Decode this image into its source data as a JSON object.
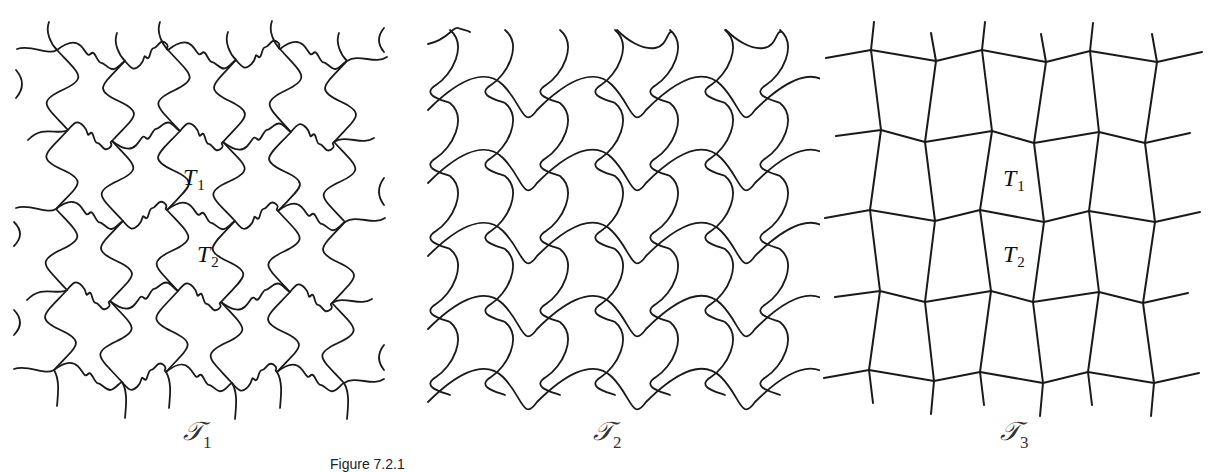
{
  "figure": {
    "caption_partial": "Figure 7.2.1",
    "line_color": "#1a1a1a",
    "background": "#ffffff"
  },
  "panels": [
    {
      "id": "T1",
      "caption": {
        "symbol": "𝒯",
        "subscript": "1"
      },
      "style": "wavy-puzzle",
      "tile_labels": [
        {
          "text": "T",
          "subscript": "1",
          "x": 183,
          "y": 165
        },
        {
          "text": "T",
          "subscript": "2",
          "x": 197,
          "y": 242
        }
      ],
      "vertices": [
        [
          [
            57,
            50
          ],
          [
            125,
            61
          ],
          [
            168,
            50
          ],
          [
            236,
            60
          ],
          [
            280,
            49
          ],
          [
            347,
            61
          ]
        ],
        [
          [
            68,
            130
          ],
          [
            112,
            141
          ],
          [
            180,
            131
          ],
          [
            223,
            142
          ],
          [
            291,
            132
          ],
          [
            334,
            142
          ]
        ],
        [
          [
            56,
            209
          ],
          [
            123,
            221
          ],
          [
            167,
            210
          ],
          [
            235,
            221
          ],
          [
            278,
            211
          ],
          [
            345,
            222
          ]
        ],
        [
          [
            67,
            290
          ],
          [
            110,
            301
          ],
          [
            178,
            291
          ],
          [
            221,
            302
          ],
          [
            290,
            292
          ],
          [
            332,
            303
          ]
        ],
        [
          [
            54,
            370
          ],
          [
            122,
            382
          ],
          [
            166,
            372
          ],
          [
            232,
            383
          ],
          [
            277,
            372
          ],
          [
            344,
            383
          ]
        ]
      ]
    },
    {
      "id": "T2",
      "caption": {
        "symbol": "𝒯",
        "subscript": "2"
      },
      "style": "wavy-lines",
      "tile_labels": []
    },
    {
      "id": "T3",
      "caption": {
        "symbol": "𝒯",
        "subscript": "3"
      },
      "style": "straight-grid",
      "tile_labels": [
        {
          "text": "T",
          "subscript": "1",
          "x": 1003,
          "y": 166
        },
        {
          "text": "T",
          "subscript": "2",
          "x": 1003,
          "y": 242
        }
      ],
      "vertices": [
        [
          [
            871,
            50
          ],
          [
            936,
            61
          ],
          [
            982,
            50
          ],
          [
            1046,
            62
          ],
          [
            1090,
            51
          ],
          [
            1157,
            62
          ]
        ],
        [
          [
            881,
            130
          ],
          [
            925,
            142
          ],
          [
            992,
            131
          ],
          [
            1034,
            143
          ],
          [
            1099,
            132
          ],
          [
            1145,
            143
          ]
        ],
        [
          [
            870,
            210
          ],
          [
            935,
            221
          ],
          [
            980,
            210
          ],
          [
            1044,
            222
          ],
          [
            1089,
            211
          ],
          [
            1155,
            222
          ]
        ],
        [
          [
            880,
            291
          ],
          [
            925,
            302
          ],
          [
            991,
            291
          ],
          [
            1033,
            302
          ],
          [
            1099,
            292
          ],
          [
            1143,
            303
          ]
        ],
        [
          [
            869,
            370
          ],
          [
            934,
            381
          ],
          [
            980,
            372
          ],
          [
            1043,
            383
          ],
          [
            1088,
            372
          ],
          [
            1154,
            383
          ]
        ]
      ]
    }
  ]
}
